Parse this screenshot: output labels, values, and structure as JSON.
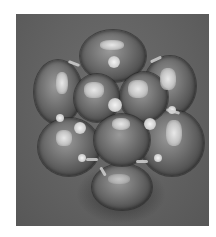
{
  "image": {
    "description": "Grayscale photograph of a faceted gemstone cluster jewelry piece on a gray background",
    "colors": {
      "border": "#ffffff",
      "background": "#626262",
      "gem_dark": "#3e3e3e",
      "gem_mid": "#6a6a6a",
      "highlight": "#e8e8e8"
    }
  }
}
